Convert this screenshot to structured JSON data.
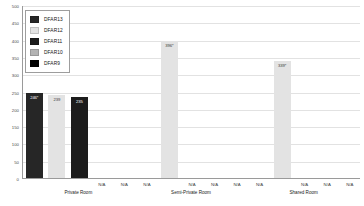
{
  "chart_data": {
    "type": "bar",
    "title": "",
    "xlabel": "",
    "ylabel": "",
    "ylim": [
      0,
      500
    ],
    "yticks": [
      0,
      50,
      100,
      150,
      200,
      250,
      300,
      350,
      400,
      450,
      500
    ],
    "ytick_labels": [
      "0",
      "50",
      "100",
      "150",
      "200",
      "250",
      "300",
      "350",
      "400",
      "450",
      "500"
    ],
    "grid": true,
    "legend_position": "upper-left",
    "categories": [
      "Private Room",
      "Semi-Private Room",
      "Shared Room"
    ],
    "series": [
      {
        "name": "DFAR13",
        "color": "#262626",
        "values": [
          246,
          null,
          null
        ],
        "labels": [
          "246*",
          "N/A",
          "N/A"
        ]
      },
      {
        "name": "DFAR12",
        "color": "#e3e3e3",
        "values": [
          239,
          396,
          339
        ],
        "labels": [
          "239",
          "396*",
          "339*"
        ]
      },
      {
        "name": "DFAR11",
        "color": "#1c1c1c",
        "values": [
          235,
          null,
          null
        ],
        "labels": [
          "235",
          "N/A",
          "N/A"
        ]
      },
      {
        "name": "DFAR10",
        "color": "#b3b3b3",
        "values": [
          null,
          null,
          null
        ],
        "labels": [
          "N/A",
          "N/A",
          "N/A"
        ]
      },
      {
        "name": "DFAR9",
        "color": "#000000",
        "values": [
          null,
          null,
          null
        ],
        "labels": [
          "N/A",
          "N/A",
          "N/A"
        ]
      }
    ],
    "na_text": "N/A"
  },
  "legend": {
    "items": [
      {
        "label": "DFAR13",
        "color": "#262626"
      },
      {
        "label": "DFAR12",
        "color": "#e3e3e3"
      },
      {
        "label": "DFAR11",
        "color": "#1c1c1c"
      },
      {
        "label": "DFAR10",
        "color": "#b3b3b3"
      },
      {
        "label": "DFAR9",
        "color": "#000000"
      }
    ]
  },
  "axis": {
    "y_max_label": "500",
    "y_min_label": "0"
  }
}
